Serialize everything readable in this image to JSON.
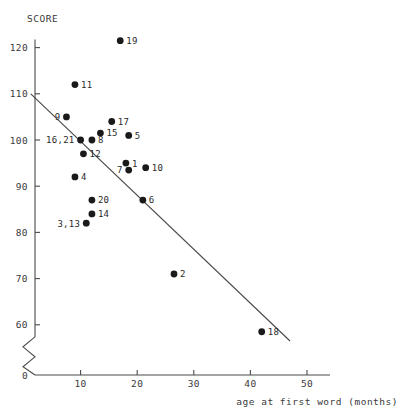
{
  "chart_data": {
    "type": "scatter",
    "title": "",
    "xlabel": "age at first word (months)",
    "ylabel": "SCORE",
    "xlim": [
      0,
      52
    ],
    "ylim": [
      55,
      125
    ],
    "grid": false,
    "legend": false,
    "y_axis_break": true,
    "y_break_note": "axis broken between 0 and 60",
    "xticks": [
      0,
      10,
      20,
      30,
      40,
      50
    ],
    "xticklabels": [
      "0",
      "10",
      "20",
      "30",
      "40",
      "50"
    ],
    "yticks": [
      60,
      70,
      80,
      90,
      100,
      110,
      120
    ],
    "yticklabels": [
      "60",
      "70",
      "80",
      "90",
      "100",
      "110",
      "120"
    ],
    "point_label_field": "case id",
    "points": [
      {
        "label": "19",
        "x": 17.0,
        "y": 121.5,
        "label_side": "right"
      },
      {
        "label": "11",
        "x": 9.0,
        "y": 112.0,
        "label_side": "right"
      },
      {
        "label": "9",
        "x": 7.5,
        "y": 105.0,
        "label_side": "left"
      },
      {
        "label": "17",
        "x": 15.5,
        "y": 104.0,
        "label_side": "right"
      },
      {
        "label": "15",
        "x": 13.5,
        "y": 101.5,
        "label_side": "right"
      },
      {
        "label": "5",
        "x": 18.5,
        "y": 101.0,
        "label_side": "right"
      },
      {
        "label": "16,21",
        "x": 10.0,
        "y": 100.0,
        "label_side": "left"
      },
      {
        "label": "8",
        "x": 12.0,
        "y": 100.0,
        "label_side": "right"
      },
      {
        "label": "12",
        "x": 10.5,
        "y": 97.0,
        "label_side": "right"
      },
      {
        "label": "1",
        "x": 18.0,
        "y": 95.0,
        "label_side": "right"
      },
      {
        "label": "10",
        "x": 21.5,
        "y": 94.0,
        "label_side": "right"
      },
      {
        "label": "7",
        "x": 18.5,
        "y": 93.5,
        "label_side": "left"
      },
      {
        "label": "4",
        "x": 9.0,
        "y": 92.0,
        "label_side": "right"
      },
      {
        "label": "6",
        "x": 21.0,
        "y": 87.0,
        "label_side": "right"
      },
      {
        "label": "20",
        "x": 12.0,
        "y": 87.0,
        "label_side": "right"
      },
      {
        "label": "14",
        "x": 12.0,
        "y": 84.0,
        "label_side": "right"
      },
      {
        "label": "3,13",
        "x": 11.0,
        "y": 82.0,
        "label_side": "left"
      },
      {
        "label": "2",
        "x": 26.5,
        "y": 71.0,
        "label_side": "right"
      },
      {
        "label": "18",
        "x": 42.0,
        "y": 58.5,
        "label_side": "right"
      }
    ],
    "fit_line": {
      "name": "least-squares regression line",
      "x_start": 1.2,
      "y_start": 110.0,
      "x_end": 47.0,
      "y_end": 56.5
    }
  }
}
